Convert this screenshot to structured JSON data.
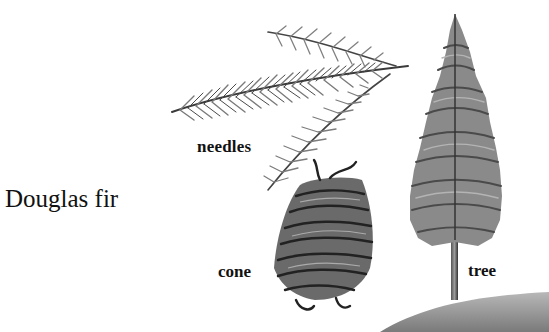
{
  "title": "Douglas fir",
  "labels": {
    "needles": "needles",
    "cone": "cone",
    "tree": "tree"
  },
  "illustrations": [
    {
      "name": "needles-branch",
      "description": "Douglas fir branch sprig with needles"
    },
    {
      "name": "cone",
      "description": "Douglas fir cone"
    },
    {
      "name": "tree",
      "description": "Whole Douglas fir tree on a small hill"
    }
  ],
  "colors": {
    "background": "#ffffff",
    "text": "#111111",
    "ink_dark": "#2a2a2a",
    "ink_mid": "#6e6e6e",
    "ink_light": "#a8a8a8"
  }
}
